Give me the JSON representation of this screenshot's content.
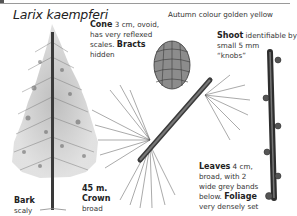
{
  "page": {
    "title": "Larix kaempferi",
    "autumn_note": "Autumn colour golden yellow"
  },
  "annotations": {
    "cone": {
      "label": "Cone",
      "text_1": " 3 cm, ovoid,",
      "text_2": "has very reflexed",
      "text_3": "scales. ",
      "label_2": "Bracts",
      "text_4": "hidden"
    },
    "shoot": {
      "label": "Shoot",
      "text_1": " identifiable by",
      "text_2": "small 5 mm",
      "text_3": "“knobs”"
    },
    "leaves": {
      "label": "Leaves",
      "text_1": " 4 cm,",
      "text_2": "broad, with 2",
      "text_3": "wide grey bands",
      "text_4": "below. ",
      "label_2": "Foliage",
      "text_5": "very densely set"
    },
    "bark": {
      "label": "Bark",
      "text": "scaly"
    },
    "crown": {
      "height": "45 m.",
      "label": "Crown",
      "text": "broad"
    }
  },
  "illustrations": {
    "tree": "larch-tree-illustration",
    "cone_branch": "cone-on-branch-illustration",
    "shoot": "twig-with-knobs-illustration"
  }
}
